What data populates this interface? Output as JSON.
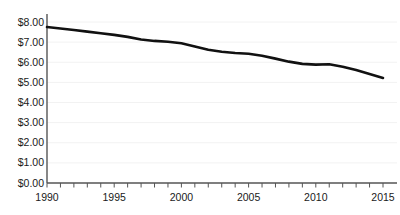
{
  "chart_data": {
    "type": "line",
    "title": "",
    "subtitle": "",
    "xlabel": "",
    "ylabel": "",
    "xlim": [
      1990,
      2015
    ],
    "ylim": [
      0,
      8
    ],
    "grid": true,
    "legend": null,
    "y_tick_labels": [
      "$8.00",
      "$7.00",
      "$6.00",
      "$5.00",
      "$4.00",
      "$3.00",
      "$2.00",
      "$1.00",
      "$0.00"
    ],
    "y_tick_values": [
      8,
      7,
      6,
      5,
      4,
      3,
      2,
      1,
      0
    ],
    "x_tick_labels": [
      "1990",
      "1995",
      "2000",
      "2005",
      "2010",
      "2015"
    ],
    "x_tick_values": [
      1990,
      1995,
      2000,
      2005,
      2010,
      2015
    ],
    "x_minor_tick_values": [
      1990,
      1991,
      1992,
      1993,
      1994,
      1995,
      1996,
      1997,
      1998,
      1999,
      2000,
      2001,
      2002,
      2003,
      2004,
      2005,
      2006,
      2007,
      2008,
      2009,
      2010,
      2011,
      2012,
      2013,
      2014,
      2015
    ],
    "series": [
      {
        "name": "value",
        "color": "#111111",
        "line_width": 2.6,
        "x": [
          1990,
          1991,
          1992,
          1993,
          1994,
          1995,
          1996,
          1997,
          1998,
          1999,
          2000,
          2001,
          2002,
          2003,
          2004,
          2005,
          2006,
          2007,
          2008,
          2009,
          2010,
          2011,
          2012,
          2013,
          2014,
          2015
        ],
        "values": [
          7.75,
          7.68,
          7.6,
          7.52,
          7.44,
          7.36,
          7.26,
          7.13,
          7.06,
          7.02,
          6.94,
          6.78,
          6.62,
          6.52,
          6.46,
          6.42,
          6.32,
          6.18,
          6.03,
          5.92,
          5.88,
          5.9,
          5.78,
          5.62,
          5.42,
          5.22
        ]
      }
    ],
    "colors": {
      "line": "#111111",
      "axis": "#555555",
      "gridline": "#f2f2f2",
      "text": "#1a1a1a",
      "background": "#ffffff"
    }
  }
}
